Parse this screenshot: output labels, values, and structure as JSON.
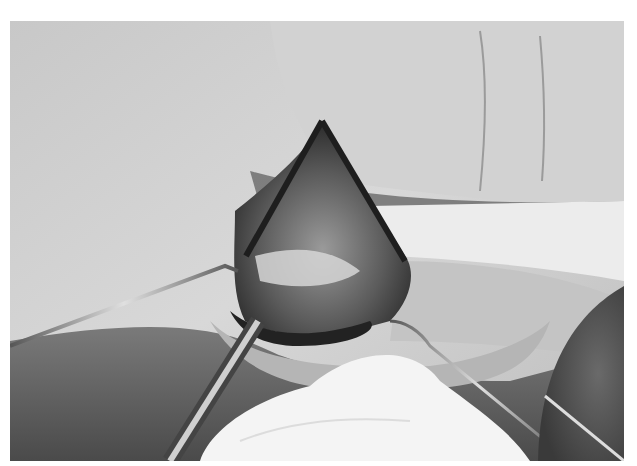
{
  "image": {
    "alt": "Grayscale intraoperative photograph of a triangular skin flap raised on a finger, retracted with wire hooks and a metal instrument, with gauze in the lower center",
    "palette": {
      "skin_light": "#d6d6d6",
      "skin_mid": "#b4b4b4",
      "shadow": "#3a3a3a",
      "tissue_dark": "#2a2a2a",
      "gauze": "#f4f4f4",
      "metal": "#9a9a9a",
      "bowl": "#4a4a4a"
    }
  }
}
